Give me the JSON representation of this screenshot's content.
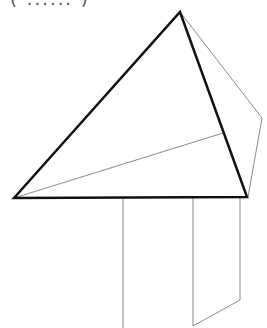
{
  "caption": "( ...... )",
  "figure": {
    "bold_triangle": [
      [
        14,
        198
      ],
      [
        180,
        12
      ],
      [
        247,
        197
      ]
    ],
    "thin_back_edges": [
      [
        180,
        12
      ],
      [
        262,
        118
      ],
      [
        248,
        197
      ]
    ],
    "thin_interior_line": [
      [
        14,
        198
      ],
      [
        223,
        133
      ]
    ],
    "prism_lines": [
      [
        [
          123,
          198
        ],
        [
          123,
          328
        ]
      ],
      [
        [
          193,
          198
        ],
        [
          193,
          326
        ]
      ],
      [
        [
          240,
          198
        ],
        [
          240,
          300
        ]
      ],
      [
        [
          240,
          300
        ],
        [
          193,
          326
        ]
      ]
    ],
    "colors": {
      "bold": "#111111",
      "thin": "#888888"
    }
  }
}
